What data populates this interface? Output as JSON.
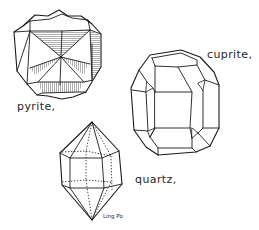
{
  "figure": {
    "labels": {
      "pyrite": "pyrite,",
      "cuprite": "cuprite,",
      "quartz": "quartz,"
    },
    "signature": "Ling Po",
    "colors": {
      "ink": "#1a1a1a",
      "background": "#ffffff"
    },
    "crystals": [
      {
        "name": "pyrite",
        "form": "pyritohedron with hatched faces"
      },
      {
        "name": "cuprite",
        "form": "truncated cube-octahedron"
      },
      {
        "name": "quartz",
        "form": "hexagonal bipyramid with prism"
      }
    ]
  }
}
